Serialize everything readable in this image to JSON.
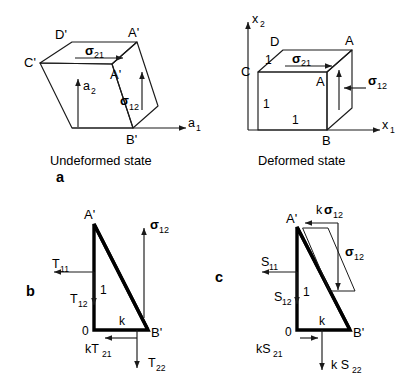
{
  "figure": {
    "line_color": "#1a1a1a",
    "text_color": "#000000",
    "background": "#ffffff"
  },
  "panels": {
    "a": {
      "label": "a",
      "left": {
        "caption": "Undeformed state",
        "vertices": {
          "D": "D'",
          "C": "C'",
          "A_top": "A'",
          "A_front": "A'",
          "B": "B'"
        },
        "axes": {
          "x": "a",
          "x_sub": "1",
          "y": "a",
          "y_sub": "2"
        },
        "stress_top": {
          "symbol": "σ",
          "sub": "21"
        },
        "stress_right": {
          "symbol": "σ",
          "sub": "12"
        }
      },
      "right": {
        "caption": "Deformed state",
        "vertices": {
          "D": "D",
          "C": "C",
          "A_top": "A",
          "A_front": "A",
          "B": "B"
        },
        "axes": {
          "x": "x",
          "x_sub": "1",
          "y": "x",
          "y_sub": "2"
        },
        "stress_top": {
          "symbol": "σ",
          "sub": "21"
        },
        "stress_right": {
          "symbol": "σ",
          "sub": "12"
        },
        "dimensions": [
          "1",
          "1",
          "1"
        ]
      }
    },
    "b": {
      "label": "b",
      "vertices": {
        "A": "A'",
        "B": "B'",
        "origin": "0"
      },
      "side_labels": {
        "height": "1",
        "base": "k"
      },
      "stress_right": {
        "symbol": "σ",
        "sub": "12"
      },
      "tractions": [
        {
          "name": "T",
          "sub": "11",
          "prefix": ""
        },
        {
          "name": "T",
          "sub": "12",
          "prefix": ""
        },
        {
          "name": "T",
          "sub": "21",
          "prefix": "k"
        },
        {
          "name": "T",
          "sub": "22",
          "prefix": ""
        }
      ]
    },
    "c": {
      "label": "c",
      "vertices": {
        "A": "A'",
        "B": "B'",
        "origin": "0"
      },
      "side_labels": {
        "height": "1",
        "base": "k"
      },
      "stress_top": {
        "prefix": "k",
        "symbol": "σ",
        "sub": "12"
      },
      "stress_right": {
        "symbol": "σ",
        "sub": "12"
      },
      "tractions": [
        {
          "name": "S",
          "sub": "11",
          "prefix": ""
        },
        {
          "name": "S",
          "sub": "12",
          "prefix": ""
        },
        {
          "name": "S",
          "sub": "21",
          "prefix": "k"
        },
        {
          "name": "S",
          "sub": "22",
          "prefix": "k "
        }
      ]
    }
  },
  "text": {
    "a_label": "a",
    "b_label": "b",
    "c_label": "c",
    "undeformed_caption": "Undeformed state",
    "deformed_caption": "Deformed state",
    "sigma": "σ",
    "sigma_21": "21",
    "sigma_12": "12",
    "A_prime": "A'",
    "B_prime": "B'",
    "C_prime": "C'",
    "D_prime": "D'",
    "A": "A",
    "B": "B",
    "C": "C",
    "D": "D",
    "zero": "0",
    "one": "1",
    "k": "k",
    "a_axis": "a",
    "x_axis": "x",
    "sub1": "1",
    "sub2": "2",
    "T": "T",
    "S": "S",
    "T11": "11",
    "T12": "12",
    "T21": "21",
    "T22": "22",
    "kT21": "kT",
    "kS21": "kS",
    "kS22": "k S",
    "ksigma": "k"
  }
}
